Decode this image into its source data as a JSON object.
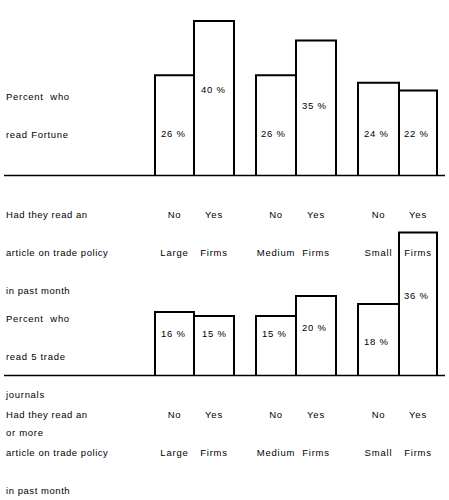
{
  "figure": {
    "title": "",
    "background_color": "#ffffff",
    "line_color": "#000000",
    "text_color": "#000000"
  },
  "charts": [
    {
      "id": "fortune-chart",
      "y_axis_label": "Percent who\nread Fortune",
      "y_axis_label_lines": [
        "Percent  who",
        "read Fortune"
      ],
      "x_axis_caption_lines": [
        "Had they read an",
        "article on trade policy",
        "in past month"
      ],
      "groups": [
        {
          "name": "Large Firms",
          "bars": [
            {
              "tick_top": "No",
              "tick_bottom": "Large",
              "value": 26,
              "label": "26 %"
            },
            {
              "tick_top": "Yes",
              "tick_bottom": "Firms",
              "value": 40,
              "label": "40 %"
            }
          ]
        },
        {
          "name": "Medium Firms",
          "bars": [
            {
              "tick_top": "No",
              "tick_bottom": "Medium",
              "value": 26,
              "label": "26 %"
            },
            {
              "tick_top": "Yes",
              "tick_bottom": "Firms",
              "value": 35,
              "label": "35 %"
            }
          ]
        },
        {
          "name": "Small Firms",
          "bars": [
            {
              "tick_top": "No",
              "tick_bottom": "Small",
              "value": 24,
              "label": "24 %"
            },
            {
              "tick_top": "Yes",
              "tick_bottom": "Firms",
              "value": 22,
              "label": "22 %"
            }
          ]
        }
      ]
    },
    {
      "id": "trade-journals-chart",
      "y_axis_label": "Percent who\nread 5 trade\njournals\nor more",
      "y_axis_label_lines": [
        "Percent  who",
        "read 5 trade",
        "journals",
        "or more"
      ],
      "x_axis_caption_lines": [
        "Had they read an",
        "article on trade policy",
        "in past month"
      ],
      "groups": [
        {
          "name": "Large Firms",
          "bars": [
            {
              "tick_top": "No",
              "tick_bottom": "Large",
              "value": 16,
              "label": "16 %"
            },
            {
              "tick_top": "Yes",
              "tick_bottom": "Firms",
              "value": 15,
              "label": "15 %"
            }
          ]
        },
        {
          "name": "Medium Firms",
          "bars": [
            {
              "tick_top": "No",
              "tick_bottom": "Medium",
              "value": 15,
              "label": "15 %"
            },
            {
              "tick_top": "Yes",
              "tick_bottom": "Firms",
              "value": 20,
              "label": "20 %"
            }
          ]
        },
        {
          "name": "Small Firms",
          "bars": [
            {
              "tick_top": "No",
              "tick_bottom": "Small",
              "value": 18,
              "label": "18 %"
            },
            {
              "tick_top": "Yes",
              "tick_bottom": "Firms",
              "value": 36,
              "label": "36 %"
            }
          ]
        }
      ]
    }
  ],
  "chart_data": [
    {
      "type": "bar",
      "title": "Percent who read Fortune",
      "xlabel": "Had they read an article on trade policy in past month",
      "ylabel": "Percent who read Fortune",
      "categories": [
        "No / Large Firms",
        "Yes / Large Firms",
        "No / Medium Firms",
        "Yes / Medium Firms",
        "No / Small Firms",
        "Yes / Small Firms"
      ],
      "values": [
        26,
        40,
        26,
        35,
        24,
        22
      ],
      "data_labels": [
        "26 %",
        "40 %",
        "26 %",
        "35 %",
        "24 %",
        "22 %"
      ],
      "ylim": [
        0,
        45
      ],
      "grid": false,
      "legend": "none"
    },
    {
      "type": "bar",
      "title": "Percent who read 5 trade journals or more",
      "xlabel": "Had they read an article on trade policy in past month",
      "ylabel": "Percent who read 5 trade journals or more",
      "categories": [
        "No / Large Firms",
        "Yes / Large Firms",
        "No / Medium Firms",
        "Yes / Medium Firms",
        "No / Small Firms",
        "Yes / Small Firms"
      ],
      "values": [
        16,
        15,
        15,
        20,
        18,
        36
      ],
      "data_labels": [
        "16 %",
        "15 %",
        "15 %",
        "20 %",
        "18 %",
        "36 %"
      ],
      "ylim": [
        0,
        45
      ],
      "grid": false,
      "legend": "none"
    }
  ]
}
